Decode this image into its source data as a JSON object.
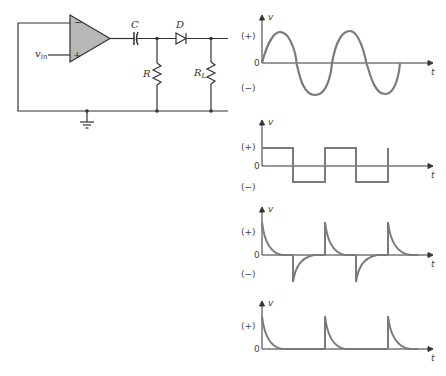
{
  "circuit": {
    "input_label": "v",
    "input_sub": "in",
    "opamp_minus": "−",
    "opamp_plus": "+",
    "capacitor_label": "C",
    "diode_label": "D",
    "resistor_label": "R",
    "load_label": "R",
    "load_sub": "L",
    "colors": {
      "wire": "#333333",
      "opamp_fill": "#b8b8b8"
    }
  },
  "plots": [
    {
      "name": "sine",
      "ylabel": "v",
      "xlabel": "t",
      "pos": "(+)",
      "zero": "0",
      "neg": "(−)"
    },
    {
      "name": "square",
      "ylabel": "v",
      "xlabel": "t",
      "pos": "(+)",
      "zero": "0",
      "neg": "(−)"
    },
    {
      "name": "differentiated",
      "ylabel": "v",
      "xlabel": "t",
      "pos": "(+)",
      "zero": "0",
      "neg": "(−)"
    },
    {
      "name": "rectified",
      "ylabel": "v",
      "xlabel": "t",
      "pos": "(+)",
      "zero": "0"
    }
  ],
  "colors": {
    "trace": "#7a7a7a",
    "axis": "#333333"
  }
}
